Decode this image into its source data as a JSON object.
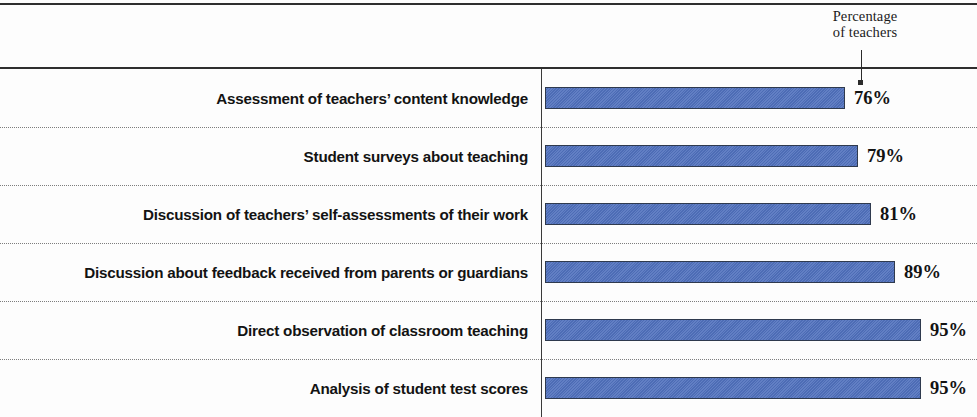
{
  "annotation": {
    "line1": "Percentage",
    "line2": "of teachers"
  },
  "chart_data": {
    "type": "bar",
    "orientation": "horizontal",
    "title": "",
    "subtitle": "",
    "xlabel": "",
    "ylabel": "",
    "annotation": "Percentage of teachers",
    "grid": false,
    "legend": false,
    "xlim": [
      0,
      100
    ],
    "value_suffix": "%",
    "bar_color": "#5071bd",
    "bar_border_color": "#2f3a4e",
    "separator_color": "#7d7d7d",
    "categories": [
      "Assessment of teachers’ content knowledge",
      "Student surveys about teaching",
      "Discussion of teachers’ self-assessments of their work",
      "Discussion about feedback received from parents or guardians",
      "Direct observation of classroom teaching",
      "Analysis of student test scores"
    ],
    "values": [
      76,
      79,
      81,
      89,
      95,
      95
    ],
    "value_labels": [
      "76%",
      "79%",
      "81%",
      "89%",
      "95%",
      "95%"
    ],
    "rows": [
      {
        "label": "Assessment of teachers’ content knowledge",
        "value": 76,
        "value_label": "76%",
        "bar_width_px": 300
      },
      {
        "label": "Student surveys about teaching",
        "value": 79,
        "value_label": "79%",
        "bar_width_px": 313
      },
      {
        "label": "Discussion of teachers’ self-assessments of their work",
        "value": 81,
        "value_label": "81%",
        "bar_width_px": 326
      },
      {
        "label": "Discussion about feedback received from parents or guardians",
        "value": 89,
        "value_label": "89%",
        "bar_width_px": 350
      },
      {
        "label": "Direct observation of classroom teaching",
        "value": 95,
        "value_label": "95%",
        "bar_width_px": 376
      },
      {
        "label": "Analysis of student test scores",
        "value": 95,
        "value_label": "95%",
        "bar_width_px": 376
      }
    ]
  }
}
